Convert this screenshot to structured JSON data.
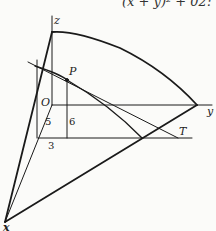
{
  "header": {
    "equation_fragment": "(x + y)² + 02:"
  },
  "labels": {
    "z": "z",
    "y": "y",
    "x": "x",
    "O": "O",
    "P": "P",
    "T": "T"
  },
  "dimensions": {
    "d5": "5",
    "d6": "6",
    "d3": "3"
  },
  "colors": {
    "line": "#1a1a1a",
    "background": "#fbfbf9"
  }
}
